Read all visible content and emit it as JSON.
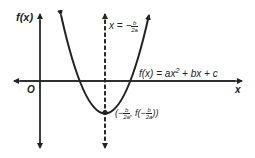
{
  "diagram": {
    "y_axis_label": "f(x)",
    "x_axis_label": "x",
    "origin_label": "O",
    "axis_of_symmetry": {
      "lhs": "x = −",
      "num": "b",
      "den": "2a"
    },
    "function_label": {
      "prefix": "f(x) = ax",
      "exp": "2",
      "suffix": " + bx + c"
    },
    "vertex_label": {
      "open": "(−",
      "num1": "b",
      "den1": "2a",
      "mid": ", f(−",
      "num2": "b",
      "den2": "2a",
      "close": "))"
    },
    "colors": {
      "line": "#222222",
      "background": "#ffffff"
    }
  }
}
